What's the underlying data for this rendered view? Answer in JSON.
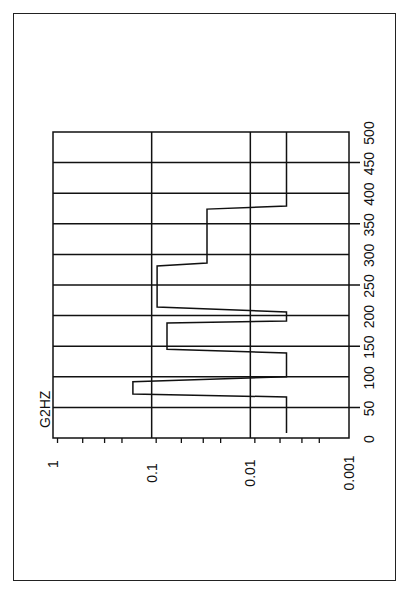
{
  "chart_data": {
    "type": "line",
    "orientation": "rotated-90-ccw",
    "title": "",
    "series_label": "G2HZ",
    "xlabel": "",
    "ylabel": "",
    "x_axis": {
      "label": "",
      "range": [
        0,
        500
      ],
      "ticks": [
        0,
        50,
        100,
        150,
        200,
        250,
        300,
        350,
        400,
        450,
        500
      ],
      "tick_labels": [
        "0",
        "50",
        "100",
        "150",
        "200",
        "250",
        "300",
        "350",
        "400",
        "450",
        "500"
      ],
      "grid": true
    },
    "y_axis": {
      "scale": "log",
      "range": [
        0.001,
        1
      ],
      "ticks": [
        1,
        0.1,
        0.01,
        0.001
      ],
      "tick_labels": [
        "1",
        "0.1",
        "0.01",
        "0.001"
      ],
      "grid": true
    },
    "series": [
      {
        "name": "G2HZ",
        "style": "step",
        "x": [
          8,
          67,
          72,
          92,
          100,
          139,
          145,
          188,
          191,
          206,
          214,
          281,
          286,
          374,
          379,
          500
        ],
        "values": [
          0.0043,
          0.0043,
          0.155,
          0.155,
          0.0043,
          0.0043,
          0.07,
          0.07,
          0.0043,
          0.0043,
          0.088,
          0.088,
          0.0275,
          0.0275,
          0.0043,
          0.0043
        ]
      }
    ],
    "legend": {
      "position": "none"
    }
  },
  "labels": {
    "series_label": "G2HZ",
    "y_ticks": [
      "1",
      "0.1",
      "0.01",
      "0.001"
    ],
    "x_ticks": [
      "0",
      "50",
      "100",
      "150",
      "200",
      "250",
      "300",
      "350",
      "400",
      "450",
      "500"
    ]
  }
}
